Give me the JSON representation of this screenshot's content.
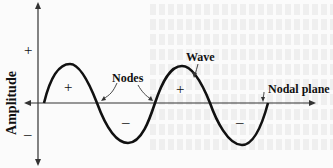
{
  "figure": {
    "y_axis_label": "Amplitude",
    "y_axis_signs": {
      "positive": "+",
      "negative": "–"
    },
    "labels": {
      "wave": "Wave",
      "nodes": "Nodes",
      "nodal_plane": "Nodal plane"
    },
    "lobe_signs": [
      "+",
      "–",
      "+",
      "–"
    ],
    "colors": {
      "stroke": "#111111",
      "background": "#fbfbfb"
    }
  }
}
